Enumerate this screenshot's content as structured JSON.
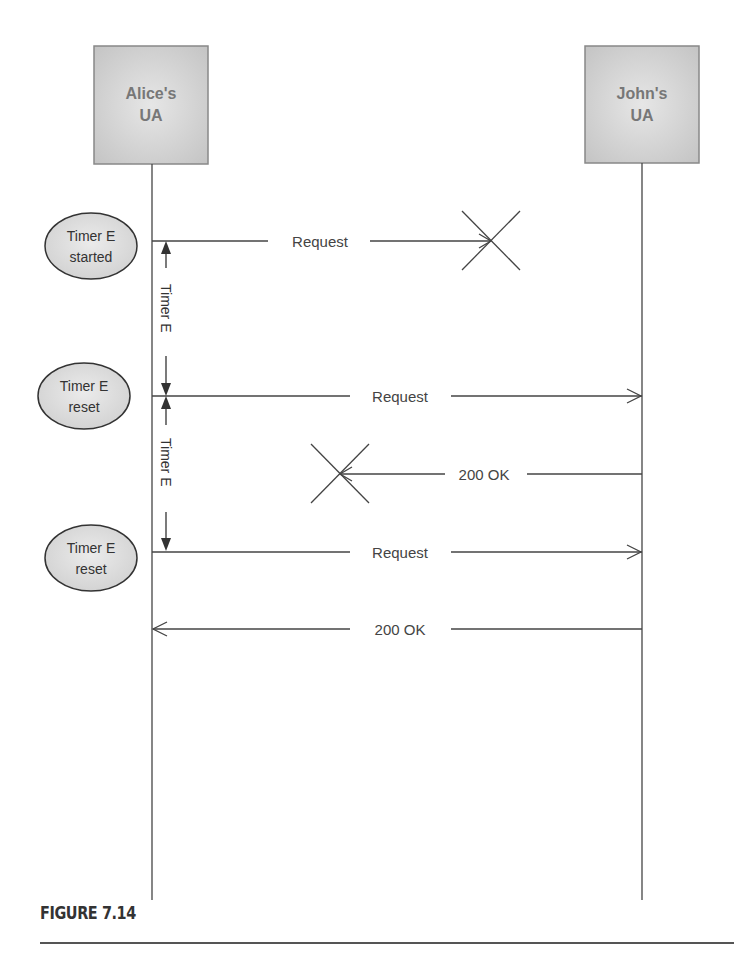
{
  "actors": [
    {
      "line1": "Alice's",
      "line2": "UA"
    },
    {
      "line1": "John's",
      "line2": "UA"
    }
  ],
  "states": [
    {
      "line1": "Timer E",
      "line2": "started"
    },
    {
      "line1": "Timer E",
      "line2": "reset"
    },
    {
      "line1": "Timer E",
      "line2": "reset"
    }
  ],
  "messages": [
    {
      "label": "Request",
      "direction": "right",
      "lost": true
    },
    {
      "label": "Request",
      "direction": "right",
      "lost": false
    },
    {
      "label": "200 OK",
      "direction": "left",
      "lost": true
    },
    {
      "label": "Request",
      "direction": "right",
      "lost": false
    },
    {
      "label": "200 OK",
      "direction": "left",
      "lost": false
    }
  ],
  "timers": [
    {
      "label": "Timer E"
    },
    {
      "label": "Timer E"
    }
  ],
  "caption": "FIGURE 7.14",
  "colors": {
    "box_fill": "#c8c8c8",
    "state_fill": "#d9d9d9",
    "line": "#444444"
  }
}
